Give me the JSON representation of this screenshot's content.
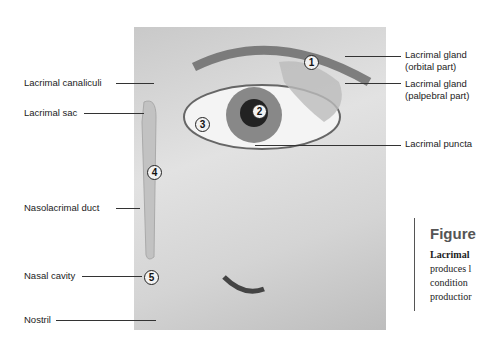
{
  "labels": {
    "canaliculi": "Lacrimal canaliculi",
    "sac": "Lacrimal sac",
    "duct": "Nasolacrimal duct",
    "cavity": "Nasal cavity",
    "nostril": "Nostril",
    "gland_orbital_1": "Lacrimal gland",
    "gland_orbital_2": "(orbital part)",
    "gland_palpebral_1": "Lacrimal gland",
    "gland_palpebral_2": "(palpebral part)",
    "puncta": "Lacrimal puncta"
  },
  "markers": [
    "1",
    "2",
    "3",
    "4",
    "5"
  ],
  "figure": {
    "title": "Figure",
    "lines": [
      "Lacrimal",
      "produces l",
      "condition",
      "productior"
    ]
  }
}
